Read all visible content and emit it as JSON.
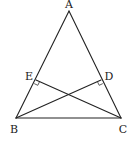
{
  "diagram": {
    "type": "geometry",
    "colors": {
      "line": "#222222",
      "label": "#222222",
      "background": "#ffffff"
    },
    "points": {
      "A": {
        "label": "A",
        "x": 69,
        "y": 11
      },
      "B": {
        "label": "B",
        "x": 16,
        "y": 118
      },
      "C": {
        "label": "C",
        "x": 121,
        "y": 118
      },
      "D": {
        "label": "D",
        "x": 101,
        "y": 80
      },
      "E": {
        "label": "E",
        "x": 36,
        "y": 80
      }
    },
    "segments": [
      {
        "from": "A",
        "to": "B"
      },
      {
        "from": "A",
        "to": "C"
      },
      {
        "from": "B",
        "to": "C"
      },
      {
        "from": "B",
        "to": "D"
      },
      {
        "from": "C",
        "to": "E"
      }
    ],
    "right_angles": [
      {
        "at": "E",
        "between": [
          "A",
          "C"
        ]
      },
      {
        "at": "D",
        "between": [
          "A",
          "B"
        ]
      }
    ]
  }
}
